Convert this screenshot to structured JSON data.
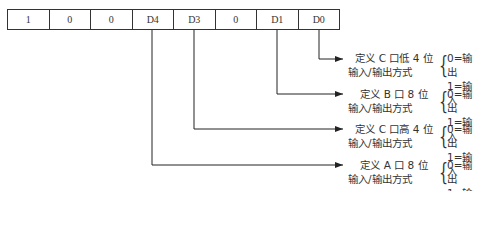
{
  "register": {
    "cells": [
      "1",
      "0",
      "0",
      "D4",
      "D3",
      "0",
      "D1",
      "D0"
    ]
  },
  "descriptions": [
    {
      "line1": "定义 C 口低 4 位",
      "line2": "输入/输出方式",
      "opt0": "0=输出",
      "opt1": "1=输入",
      "source_bit": "D0"
    },
    {
      "line1": "定义 B 口 8 位",
      "line2": "输入/输出方式",
      "opt0": "0=输出",
      "opt1": "1=输入",
      "source_bit": "D1"
    },
    {
      "line1": "定义 C 口高 4 位",
      "line2": "输入/输出方式",
      "opt0": "0=输出",
      "opt1": "1=输入",
      "source_bit": "D3"
    },
    {
      "line1": "定义 A 口 8 位",
      "line2": "输入/输出方式",
      "opt0": "0=输出",
      "opt1": "1=输入",
      "source_bit": "D4"
    }
  ]
}
